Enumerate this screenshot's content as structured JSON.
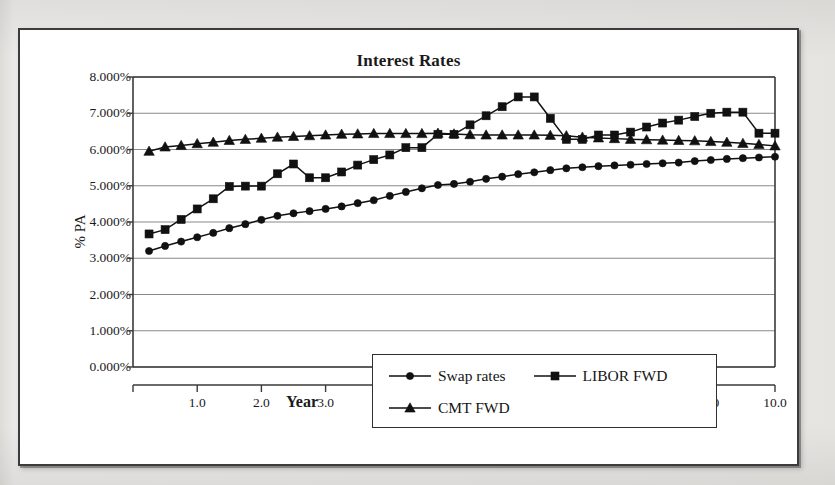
{
  "chart_data": {
    "type": "line",
    "title": "Interest Rates",
    "xlabel": "Year",
    "ylabel": "% PA",
    "xlim": [
      0.0,
      10.0
    ],
    "ylim": [
      0.0,
      8.0
    ],
    "grid": true,
    "legend_position": "bottom",
    "y_tick_labels": [
      "8.000%",
      "7.000%",
      "6.000%",
      "5.000%",
      "4.000%",
      "3.000%",
      "2.000%",
      "1.000%",
      "0.000%"
    ],
    "y_tick_values": [
      8.0,
      7.0,
      6.0,
      5.0,
      4.0,
      3.0,
      2.0,
      1.0,
      0.0
    ],
    "x_tick_labels": [
      "1.0",
      "2.0",
      "3.0",
      "4.0",
      "5.0",
      "6.0",
      "7.0",
      "8.0",
      "9.0",
      "10.0"
    ],
    "x_tick_values": [
      1.0,
      2.0,
      3.0,
      4.0,
      5.0,
      6.0,
      7.0,
      8.0,
      9.0,
      10.0
    ],
    "x": [
      0.25,
      0.5,
      0.75,
      1.0,
      1.25,
      1.5,
      1.75,
      2.0,
      2.25,
      2.5,
      2.75,
      3.0,
      3.25,
      3.5,
      3.75,
      4.0,
      4.25,
      4.5,
      4.75,
      5.0,
      5.25,
      5.5,
      5.75,
      6.0,
      6.25,
      6.5,
      6.75,
      7.0,
      7.25,
      7.5,
      7.75,
      8.0,
      8.25,
      8.5,
      8.75,
      9.0,
      9.25,
      9.5,
      9.75,
      10.0
    ],
    "series": [
      {
        "name": "Swap rates",
        "marker": "circle",
        "values": [
          3.2,
          3.34,
          3.46,
          3.58,
          3.7,
          3.83,
          3.94,
          4.06,
          4.17,
          4.24,
          4.3,
          4.36,
          4.43,
          4.52,
          4.6,
          4.72,
          4.83,
          4.93,
          5.02,
          5.05,
          5.11,
          5.19,
          5.25,
          5.32,
          5.37,
          5.43,
          5.48,
          5.51,
          5.54,
          5.56,
          5.58,
          5.6,
          5.62,
          5.64,
          5.68,
          5.71,
          5.74,
          5.76,
          5.78,
          5.8
        ]
      },
      {
        "name": "LIBOR FWD",
        "marker": "square",
        "values": [
          3.67,
          3.79,
          4.07,
          4.36,
          4.64,
          4.98,
          4.99,
          4.99,
          5.33,
          5.6,
          5.22,
          5.22,
          5.38,
          5.57,
          5.72,
          5.85,
          6.05,
          6.05,
          6.42,
          6.42,
          6.68,
          6.93,
          7.18,
          7.45,
          7.45,
          6.86,
          6.28,
          6.28,
          6.4,
          6.4,
          6.48,
          6.62,
          6.73,
          6.81,
          6.91,
          7.0,
          7.03,
          7.03,
          6.45,
          6.45
        ]
      },
      {
        "name": "CMT FWD",
        "marker": "triangle",
        "values": [
          5.95,
          6.07,
          6.11,
          6.16,
          6.2,
          6.25,
          6.28,
          6.31,
          6.34,
          6.36,
          6.38,
          6.4,
          6.42,
          6.43,
          6.44,
          6.44,
          6.44,
          6.44,
          6.45,
          6.43,
          6.41,
          6.4,
          6.4,
          6.4,
          6.4,
          6.39,
          6.38,
          6.34,
          6.32,
          6.3,
          6.28,
          6.27,
          6.26,
          6.25,
          6.24,
          6.22,
          6.2,
          6.17,
          6.14,
          6.1
        ]
      }
    ]
  },
  "legend": {
    "entries": [
      {
        "label": "Swap rates",
        "marker": "circle"
      },
      {
        "label": "LIBOR FWD",
        "marker": "square"
      },
      {
        "label": "CMT FWD",
        "marker": "triangle"
      }
    ]
  },
  "colors": {
    "series": "#111111",
    "gridline": "#888888",
    "axis": "#3a3a3a",
    "plot_background": "#ffffff",
    "page_background": "#e9e8e6",
    "frame_border": "#3c3c3c"
  }
}
